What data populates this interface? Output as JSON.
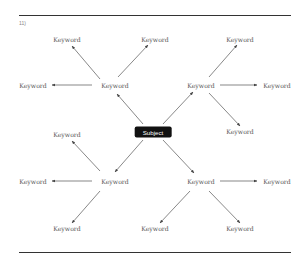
{
  "figure": {
    "label": "11)"
  },
  "diagram": {
    "center": {
      "label": "Subject",
      "x": 153,
      "y": 132
    },
    "nodes": [
      {
        "id": "hub-tl",
        "label": "Keyword",
        "x": 115,
        "y": 85
      },
      {
        "id": "hub-tr",
        "label": "Keyword",
        "x": 201,
        "y": 85
      },
      {
        "id": "hub-bl",
        "label": "Keyword",
        "x": 115,
        "y": 181
      },
      {
        "id": "hub-br",
        "label": "Keyword",
        "x": 201,
        "y": 181
      },
      {
        "id": "tl-up",
        "label": "Keyword",
        "x": 67,
        "y": 39
      },
      {
        "id": "tl-left",
        "label": "Keyword",
        "x": 33,
        "y": 85
      },
      {
        "id": "tl-upright",
        "label": "Keyword",
        "x": 155,
        "y": 39
      },
      {
        "id": "tr-up",
        "label": "Keyword",
        "x": 240,
        "y": 39
      },
      {
        "id": "tr-right",
        "label": "Keyword",
        "x": 277,
        "y": 85
      },
      {
        "id": "tr-down",
        "label": "Keyword",
        "x": 240,
        "y": 131
      },
      {
        "id": "bl-up",
        "label": "Keyword",
        "x": 67,
        "y": 134
      },
      {
        "id": "bl-left",
        "label": "Keyword",
        "x": 33,
        "y": 181
      },
      {
        "id": "bl-down",
        "label": "Keyword",
        "x": 67,
        "y": 228
      },
      {
        "id": "br-right",
        "label": "Keyword",
        "x": 277,
        "y": 181
      },
      {
        "id": "br-down",
        "label": "Keyword",
        "x": 240,
        "y": 228
      },
      {
        "id": "br-downleft",
        "label": "Keyword",
        "x": 155,
        "y": 228
      }
    ],
    "edges": [
      {
        "from": [
          143,
          124
        ],
        "to": [
          117,
          94
        ]
      },
      {
        "from": [
          163,
          124
        ],
        "to": [
          193,
          92
        ]
      },
      {
        "from": [
          143,
          140
        ],
        "to": [
          115,
          172
        ]
      },
      {
        "from": [
          163,
          140
        ],
        "to": [
          194,
          173
        ]
      },
      {
        "from": [
          100,
          79
        ],
        "to": [
          72,
          46
        ]
      },
      {
        "from": [
          118,
          77
        ],
        "to": [
          148,
          45
        ]
      },
      {
        "from": [
          92,
          85
        ],
        "to": [
          52,
          85
        ]
      },
      {
        "from": [
          209,
          77
        ],
        "to": [
          237,
          45
        ]
      },
      {
        "from": [
          220,
          85
        ],
        "to": [
          257,
          85
        ]
      },
      {
        "from": [
          209,
          93
        ],
        "to": [
          240,
          126
        ]
      },
      {
        "from": [
          100,
          171
        ],
        "to": [
          72,
          141
        ]
      },
      {
        "from": [
          92,
          181
        ],
        "to": [
          52,
          181
        ]
      },
      {
        "from": [
          100,
          191
        ],
        "to": [
          72,
          223
        ]
      },
      {
        "from": [
          220,
          181
        ],
        "to": [
          257,
          181
        ]
      },
      {
        "from": [
          209,
          191
        ],
        "to": [
          240,
          223
        ]
      },
      {
        "from": [
          190,
          191
        ],
        "to": [
          160,
          223
        ]
      }
    ],
    "line_color": "#555555"
  }
}
